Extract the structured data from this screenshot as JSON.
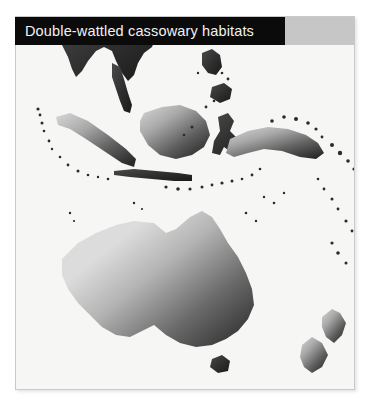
{
  "figure": {
    "title": "Double-wattled cassowary habitats",
    "background_color": "#ffffff",
    "panel_background_color": "#f6f6f5",
    "panel_border_color": "#c9c9c9",
    "banner_color": "#0b0b0b",
    "banner_text_color": "#f2f2f2",
    "legend_block_color": "#c6c6c6",
    "land_dark_color": "#2b2b2b",
    "land_light_color": "#b9b9b9",
    "ocean_color": "#f6f6f5"
  },
  "map": {
    "type": "habitat-range-map",
    "projection": "equirectangular",
    "region": "Southeast Asia, Australasia and the southwest Pacific",
    "regions_depicted": [
      "Indochina",
      "Malay Peninsula",
      "Sumatra",
      "Java",
      "Borneo",
      "Sulawesi",
      "Philippines",
      "Lesser Sunda Islands",
      "New Guinea",
      "Bismarck Archipelago",
      "Solomon Islands",
      "Vanuatu",
      "New Caledonia",
      "Australia",
      "Tasmania",
      "New Zealand"
    ],
    "landmasses": [
      {
        "name": "Indochina",
        "shade": "dark",
        "points": "50,-10 74,-6 92,0 104,6 112,14 120,10 128,4 136,10 140,20 136,30 128,36 122,46 118,58 112,64 106,56 100,44 96,34 88,30 80,34 72,44 66,54 60,60 56,52 52,40 46,28 42,16 44,2"
      },
      {
        "name": "Malay Peninsula",
        "shade": "dark",
        "points": "96,46 104,50 108,62 112,76 116,88 114,96 108,94 104,84 100,72 96,60"
      },
      {
        "name": "Sumatra",
        "shade": "gradient",
        "points": "40,100 54,96 72,104 92,118 110,132 120,142 118,150 106,146 88,134 70,122 54,112 42,108"
      },
      {
        "name": "Java",
        "shade": "dark",
        "points": "98,154 118,152 140,154 162,156 176,158 176,164 158,164 136,162 114,160 98,158"
      },
      {
        "name": "Borneo",
        "shade": "gradient",
        "points": "128,96 146,90 164,88 180,94 190,104 194,118 188,130 176,138 160,142 144,138 132,128 124,114 124,104"
      },
      {
        "name": "Sulawesi",
        "shade": "dark",
        "points": "202,100 212,96 218,104 214,114 220,120 230,116 236,122 228,132 216,136 208,130 204,138 196,136 198,124 204,114"
      },
      {
        "name": "Philippines-Luzon",
        "shade": "dark",
        "points": "186,36 196,32 204,38 206,50 200,58 192,56 186,48"
      },
      {
        "name": "Philippines-Mindanao",
        "shade": "dark",
        "points": "196,70 208,66 216,72 214,82 204,86 194,80"
      },
      {
        "name": "New-Guinea",
        "shade": "gradient",
        "points": "214,122 232,114 252,110 272,112 290,118 302,126 308,136 300,142 284,140 266,134 248,132 232,136 218,140 210,136"
      },
      {
        "name": "Australia",
        "shade": "gradient",
        "points": "46,242 62,226 80,216 100,208 118,204 138,206 150,216 160,212 174,200 186,194 196,200 204,212 212,226 222,240 230,256 236,272 238,288 232,302 222,314 210,322 196,328 180,330 164,326 150,318 138,308 126,314 114,320 100,318 86,310 74,298 62,286 52,272 46,258"
      },
      {
        "name": "Tasmania",
        "shade": "dark",
        "points": "196,342 206,338 214,344 212,354 202,356 194,350"
      },
      {
        "name": "New-Zealand-North",
        "shade": "gradient",
        "points": "306,300 316,292 324,296 330,306 326,318 318,326 310,320 306,310"
      },
      {
        "name": "New-Zealand-South",
        "shade": "gradient",
        "points": "286,328 296,320 306,326 312,338 306,350 296,356 288,350 284,340"
      }
    ],
    "island_dots": [
      {
        "cx": 22,
        "cy": 92,
        "r": 1.6
      },
      {
        "cx": 24,
        "cy": 98,
        "r": 1.4
      },
      {
        "cx": 26,
        "cy": 106,
        "r": 1.5
      },
      {
        "cx": 28,
        "cy": 114,
        "r": 1.3
      },
      {
        "cx": 33,
        "cy": 124,
        "r": 1.4
      },
      {
        "cx": 36,
        "cy": 132,
        "r": 1.2
      },
      {
        "cx": 44,
        "cy": 140,
        "r": 1.3
      },
      {
        "cx": 52,
        "cy": 148,
        "r": 1.4
      },
      {
        "cx": 62,
        "cy": 154,
        "r": 1.5
      },
      {
        "cx": 72,
        "cy": 158,
        "r": 1.3
      },
      {
        "cx": 82,
        "cy": 160,
        "r": 1.2
      },
      {
        "cx": 92,
        "cy": 162,
        "r": 1.3
      },
      {
        "cx": 150,
        "cy": 170,
        "r": 1.6
      },
      {
        "cx": 162,
        "cy": 172,
        "r": 1.8
      },
      {
        "cx": 174,
        "cy": 172,
        "r": 1.6
      },
      {
        "cx": 186,
        "cy": 170,
        "r": 1.5
      },
      {
        "cx": 196,
        "cy": 168,
        "r": 1.4
      },
      {
        "cx": 206,
        "cy": 166,
        "r": 1.6
      },
      {
        "cx": 216,
        "cy": 164,
        "r": 1.5
      },
      {
        "cx": 226,
        "cy": 162,
        "r": 1.3
      },
      {
        "cx": 236,
        "cy": 158,
        "r": 1.4
      },
      {
        "cx": 244,
        "cy": 152,
        "r": 1.3
      },
      {
        "cx": 176,
        "cy": 110,
        "r": 1.5
      },
      {
        "cx": 168,
        "cy": 118,
        "r": 1.3
      },
      {
        "cx": 190,
        "cy": 90,
        "r": 1.4
      },
      {
        "cx": 198,
        "cy": 84,
        "r": 1.3
      },
      {
        "cx": 206,
        "cy": 56,
        "r": 1.3
      },
      {
        "cx": 212,
        "cy": 62,
        "r": 1.4
      },
      {
        "cx": 200,
        "cy": 46,
        "r": 1.2
      },
      {
        "cx": 182,
        "cy": 56,
        "r": 1.2
      },
      {
        "cx": 256,
        "cy": 104,
        "r": 1.8
      },
      {
        "cx": 268,
        "cy": 100,
        "r": 1.8
      },
      {
        "cx": 280,
        "cy": 102,
        "r": 2.0
      },
      {
        "cx": 292,
        "cy": 106,
        "r": 1.8
      },
      {
        "cx": 300,
        "cy": 112,
        "r": 1.6
      },
      {
        "cx": 306,
        "cy": 120,
        "r": 1.4
      },
      {
        "cx": 316,
        "cy": 128,
        "r": 2.0
      },
      {
        "cx": 324,
        "cy": 136,
        "r": 2.2
      },
      {
        "cx": 332,
        "cy": 144,
        "r": 1.8
      },
      {
        "cx": 338,
        "cy": 152,
        "r": 1.6
      },
      {
        "cx": 346,
        "cy": 160,
        "r": 1.4
      },
      {
        "cx": 352,
        "cy": 170,
        "r": 1.6
      },
      {
        "cx": 360,
        "cy": 180,
        "r": 1.8
      },
      {
        "cx": 366,
        "cy": 190,
        "r": 1.6
      },
      {
        "cx": 302,
        "cy": 162,
        "r": 1.3
      },
      {
        "cx": 308,
        "cy": 172,
        "r": 1.4
      },
      {
        "cx": 316,
        "cy": 182,
        "r": 1.5
      },
      {
        "cx": 322,
        "cy": 192,
        "r": 1.4
      },
      {
        "cx": 330,
        "cy": 204,
        "r": 1.6
      },
      {
        "cx": 336,
        "cy": 214,
        "r": 1.4
      },
      {
        "cx": 316,
        "cy": 226,
        "r": 1.6
      },
      {
        "cx": 322,
        "cy": 236,
        "r": 1.8
      },
      {
        "cx": 330,
        "cy": 246,
        "r": 1.5
      },
      {
        "cx": 248,
        "cy": 180,
        "r": 1.2
      },
      {
        "cx": 258,
        "cy": 186,
        "r": 1.3
      },
      {
        "cx": 268,
        "cy": 176,
        "r": 1.2
      },
      {
        "cx": 118,
        "cy": 186,
        "r": 1.2
      },
      {
        "cx": 126,
        "cy": 192,
        "r": 1.1
      },
      {
        "cx": 54,
        "cy": 196,
        "r": 1.2
      },
      {
        "cx": 58,
        "cy": 204,
        "r": 1.1
      },
      {
        "cx": 230,
        "cy": 196,
        "r": 1.3
      },
      {
        "cx": 240,
        "cy": 204,
        "r": 1.2
      }
    ]
  }
}
